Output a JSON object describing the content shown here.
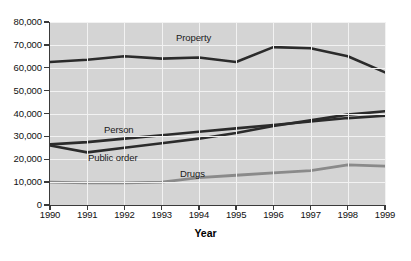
{
  "chart_data": {
    "type": "line",
    "title": "",
    "xlabel": "Year",
    "ylabel": "",
    "x": [
      1990,
      1991,
      1992,
      1993,
      1994,
      1995,
      1996,
      1997,
      1998,
      1999
    ],
    "xtick_labels": [
      "1990",
      "1991",
      "1992",
      "1993",
      "1994",
      "1995",
      "1996",
      "1997",
      "1998",
      "1999"
    ],
    "ytick_labels": [
      "0",
      "10,000",
      "20,000",
      "30,000",
      "40,000",
      "50,000",
      "60,000",
      "70,000",
      "80,000"
    ],
    "ytick_values": [
      0,
      10000,
      20000,
      30000,
      40000,
      50000,
      60000,
      70000,
      80000
    ],
    "ylim": [
      0,
      80000
    ],
    "xlim": [
      1990,
      1999
    ],
    "grid": true,
    "legend_position": "inline-labels",
    "plot_background": "#d4d4d4",
    "gridline_color": "#f2f2f2",
    "series": [
      {
        "name": "Property",
        "color": "#2b2b2b",
        "width": 2.6,
        "values": [
          62500,
          63500,
          65000,
          64000,
          64500,
          62500,
          69000,
          68500,
          65000,
          58000
        ],
        "label": {
          "text": "Property",
          "x_px": 176,
          "y_px": 32
        }
      },
      {
        "name": "Person",
        "color": "#2b2b2b",
        "width": 2.6,
        "values": [
          26500,
          27500,
          29000,
          30500,
          32000,
          33500,
          35000,
          36500,
          38000,
          39000
        ],
        "label": {
          "text": "Person",
          "x_px": 104,
          "y_px": 124
        }
      },
      {
        "name": "Public order",
        "color": "#2b2b2b",
        "width": 2.6,
        "values": [
          26000,
          23000,
          25000,
          27000,
          29000,
          31500,
          34500,
          37000,
          39500,
          41000
        ],
        "label": {
          "text": "Public order",
          "x_px": 88,
          "y_px": 152
        }
      },
      {
        "name": "Drugs",
        "color": "#8a8a8a",
        "width": 2.8,
        "values": [
          10000,
          9700,
          9700,
          10000,
          12000,
          13000,
          14000,
          15000,
          17500,
          17000
        ],
        "label": {
          "text": "Drugs",
          "x_px": 180,
          "y_px": 168
        }
      }
    ]
  },
  "axis": {
    "x_title": "Year"
  }
}
